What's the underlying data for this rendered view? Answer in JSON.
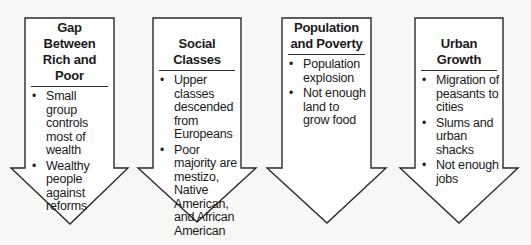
{
  "diagram": {
    "type": "flow-arrows",
    "columns": [
      {
        "heading_lines": [
          "Gap Between",
          "Rich and Poor"
        ],
        "heading": "Gap Between Rich and Poor",
        "bullets": [
          "Small group controls most of wealth",
          "Wealthy people against reforms"
        ]
      },
      {
        "heading_lines": [
          "Social Classes"
        ],
        "heading": "Social Classes",
        "bullets": [
          "Upper classes descended from Europeans",
          "Poor majority are mestizo, Native American, and African American"
        ]
      },
      {
        "heading_lines": [
          "Population",
          "and Poverty"
        ],
        "heading": "Population and Poverty",
        "bullets": [
          "Population explosion",
          "Not enough land to grow food"
        ]
      },
      {
        "heading_lines": [
          "Urban Growth"
        ],
        "heading": "Urban Growth",
        "bullets": [
          "Migration of peasants to cities",
          "Slums and urban shacks",
          "Not enough jobs"
        ]
      }
    ]
  },
  "colors": {
    "background": "#f7f7f5",
    "arrow_fill": "#ffffff",
    "stroke": "#2a2a2a",
    "text": "#1a1a1a"
  }
}
